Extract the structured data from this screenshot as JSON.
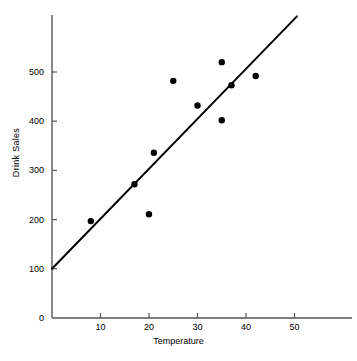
{
  "chart_data": {
    "type": "scatter",
    "title": "",
    "xlabel": "Temperature",
    "ylabel": "Drink Sales",
    "xlim": [
      0,
      59
    ],
    "ylim": [
      0,
      617
    ],
    "grid": false,
    "legend": "none",
    "xticks": [
      {
        "value": 10,
        "label": "10"
      },
      {
        "value": 20,
        "label": "20"
      },
      {
        "value": 30,
        "label": "30"
      },
      {
        "value": 40,
        "label": "40"
      },
      {
        "value": 50,
        "label": "50"
      }
    ],
    "yticks": [
      {
        "value": 0,
        "label": "0"
      },
      {
        "value": 100,
        "label": "100"
      },
      {
        "value": 200,
        "label": "200"
      },
      {
        "value": 300,
        "label": "300"
      },
      {
        "value": 400,
        "label": "400"
      },
      {
        "value": 500,
        "label": "500"
      }
    ],
    "origin_label": "0",
    "points": [
      {
        "x": 8,
        "y": 197
      },
      {
        "x": 17,
        "y": 272
      },
      {
        "x": 20,
        "y": 211
      },
      {
        "x": 21,
        "y": 336
      },
      {
        "x": 25,
        "y": 482
      },
      {
        "x": 30,
        "y": 432
      },
      {
        "x": 35,
        "y": 520
      },
      {
        "x": 35,
        "y": 402
      },
      {
        "x": 37,
        "y": 473
      },
      {
        "x": 42,
        "y": 492
      }
    ],
    "point_color": "#000000",
    "point_radius": 3.2,
    "trendline": {
      "name": "regression-line",
      "x_start": 0,
      "y_start": 100,
      "x_end": 50.5,
      "y_end": 613,
      "color": "#000000",
      "width": 2
    },
    "axis_color": "#555555"
  }
}
